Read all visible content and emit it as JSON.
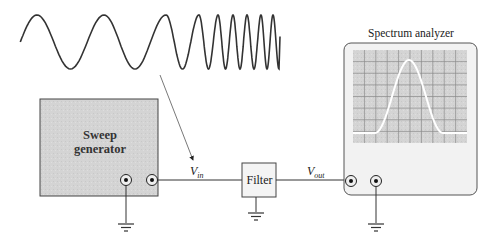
{
  "diagram": {
    "colors": {
      "line": "#333333",
      "generator_fill": "#d6d6d6",
      "screen_fill": "#c4c4c4",
      "grid": "#8a8a8a",
      "trace": "#ffffff",
      "analyzer_body": "#f0f0f0"
    },
    "sweep_signal": {
      "description": "Chirp (frequency-swept sine wave)",
      "peaks_x": [
        37,
        104,
        166,
        199,
        218,
        233,
        247,
        261,
        273
      ],
      "center_y": 42,
      "amplitude": 27
    },
    "blocks": {
      "sweep_generator": {
        "label_line1": "Sweep",
        "label_line2": "generator"
      },
      "filter": {
        "label": "Filter"
      },
      "spectrum_analyzer": {
        "label": "Spectrum analyzer"
      }
    },
    "signals": {
      "vin": {
        "symbol": "V",
        "subscript": "in"
      },
      "vout": {
        "symbol": "V",
        "subscript": "out"
      }
    },
    "analyzer_screen": {
      "grid_cols": 10,
      "grid_rows": 8,
      "trace": "Band-pass response peak (bell-shaped)"
    }
  }
}
